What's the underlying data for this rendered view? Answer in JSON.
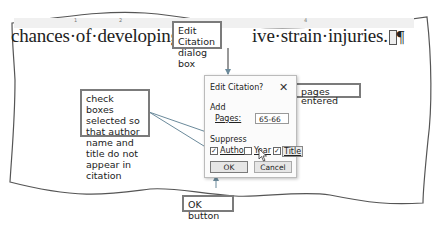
{
  "document": {
    "ruler_numbers": [
      "1",
      "2",
      "3",
      "4"
    ],
    "text_left": "chances·of·developing·the",
    "text_right": "ive·strain·injuries.",
    "paragraph_mark": "¶"
  },
  "dialog": {
    "title": "Edit Citation",
    "help": "?",
    "close": "✕",
    "add_label": "Add",
    "pages_label": "Pages:",
    "pages_value": "65-66",
    "suppress_label": "Suppress",
    "checkboxes": [
      {
        "label": "Author",
        "checked": true,
        "mark": "✓"
      },
      {
        "label": "Year",
        "checked": false,
        "mark": ""
      },
      {
        "label": "Title",
        "checked": true,
        "mark": "✓"
      }
    ],
    "ok_label": "OK",
    "cancel_label": "Cancel"
  },
  "callouts": {
    "dialog_box": "Edit Citation dialog box",
    "pages_entered": "pages entered",
    "check_boxes": "check boxes selected so that author name and title do not appear in citation",
    "ok_button": "OK button"
  },
  "colors": {
    "callout_border": "#7b7b7b",
    "arrow": "#6b8a9b"
  }
}
